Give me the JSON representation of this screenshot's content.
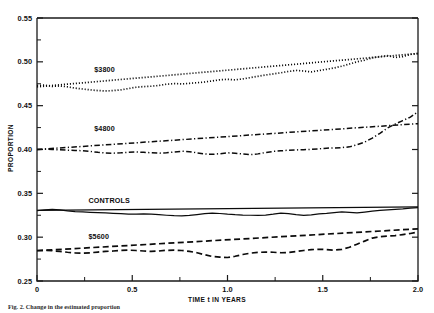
{
  "figure": {
    "caption": "Fig. 2.  Change in the estimated proportion"
  },
  "chart_data": {
    "type": "line",
    "title": "",
    "xlabel": "TIME t IN YEARS",
    "ylabel": "PROPORTION",
    "xlim": [
      0,
      2.0
    ],
    "ylim": [
      0.25,
      0.55
    ],
    "xticks": [
      0,
      0.5,
      1.0,
      1.5,
      2.0
    ],
    "xticklabels": [
      "0",
      "0.5",
      "1.0",
      "1.5",
      "2.0"
    ],
    "yticks": [
      0.25,
      0.3,
      0.35,
      0.4,
      0.45,
      0.5,
      0.55
    ],
    "yticklabels": [
      "0.25",
      "0.30",
      "0.35",
      "0.40",
      "0.45",
      "0.50",
      "0.55"
    ],
    "grid": false,
    "legend_position": "inline-labels",
    "minor_ticks": true,
    "series": [
      {
        "name": "$3800",
        "label": "$3800",
        "linestyle": "dotted",
        "label_x": 0.3,
        "label_y": 0.4885,
        "trend": {
          "linestyle": "dotted",
          "x": [
            0,
            2.0
          ],
          "values": [
            0.4715,
            0.5095
          ]
        },
        "x": [
          0.0,
          0.04,
          0.08,
          0.12,
          0.16,
          0.2,
          0.24,
          0.28,
          0.32,
          0.36,
          0.4,
          0.44,
          0.48,
          0.52,
          0.56,
          0.6,
          0.64,
          0.68,
          0.72,
          0.76,
          0.8,
          0.84,
          0.88,
          0.92,
          0.96,
          1.0,
          1.04,
          1.08,
          1.12,
          1.16,
          1.2,
          1.24,
          1.28,
          1.32,
          1.36,
          1.4,
          1.44,
          1.48,
          1.52,
          1.56,
          1.6,
          1.64,
          1.68,
          1.72,
          1.76,
          1.8,
          1.84,
          1.88,
          1.92,
          1.96,
          2.0
        ],
        "values": [
          0.473,
          0.4735,
          0.472,
          0.4725,
          0.4715,
          0.47,
          0.469,
          0.468,
          0.4672,
          0.4668,
          0.4672,
          0.468,
          0.4695,
          0.471,
          0.4718,
          0.4722,
          0.473,
          0.4745,
          0.4752,
          0.4748,
          0.4755,
          0.4762,
          0.477,
          0.4782,
          0.4795,
          0.48,
          0.4795,
          0.4805,
          0.482,
          0.4835,
          0.485,
          0.4862,
          0.4875,
          0.489,
          0.4902,
          0.4895,
          0.4885,
          0.49,
          0.4915,
          0.493,
          0.495,
          0.4975,
          0.5,
          0.502,
          0.5045,
          0.506,
          0.507,
          0.505,
          0.506,
          0.5085,
          0.5095
        ]
      },
      {
        "name": "$4800",
        "label": "$4800",
        "linestyle": "dashdot",
        "label_x": 0.3,
        "label_y": 0.4215,
        "trend": {
          "linestyle": "dashdot",
          "x": [
            0,
            2.0
          ],
          "values": [
            0.4,
            0.4295
          ]
        },
        "x": [
          0.0,
          0.04,
          0.08,
          0.12,
          0.16,
          0.2,
          0.24,
          0.28,
          0.32,
          0.36,
          0.4,
          0.44,
          0.48,
          0.52,
          0.56,
          0.6,
          0.64,
          0.68,
          0.72,
          0.76,
          0.8,
          0.84,
          0.88,
          0.92,
          0.96,
          1.0,
          1.04,
          1.08,
          1.12,
          1.16,
          1.2,
          1.24,
          1.28,
          1.32,
          1.36,
          1.4,
          1.44,
          1.48,
          1.52,
          1.56,
          1.6,
          1.64,
          1.68,
          1.72,
          1.76,
          1.8,
          1.84,
          1.88,
          1.92,
          1.96,
          2.0
        ],
        "values": [
          0.4,
          0.4005,
          0.4,
          0.3996,
          0.3992,
          0.399,
          0.3985,
          0.3978,
          0.3968,
          0.396,
          0.3958,
          0.3962,
          0.3968,
          0.3972,
          0.3968,
          0.3962,
          0.3958,
          0.3962,
          0.3972,
          0.398,
          0.3975,
          0.3962,
          0.395,
          0.3945,
          0.3952,
          0.3962,
          0.3958,
          0.3948,
          0.3942,
          0.395,
          0.3965,
          0.3978,
          0.3985,
          0.3992,
          0.3995,
          0.3998,
          0.4002,
          0.4008,
          0.4015,
          0.4018,
          0.4022,
          0.403,
          0.4055,
          0.4085,
          0.413,
          0.4185,
          0.4245,
          0.429,
          0.433,
          0.437,
          0.443
        ]
      },
      {
        "name": "CONTROLS",
        "label": "CONTROLS",
        "linestyle": "solid",
        "label_x": 0.27,
        "label_y": 0.3395,
        "trend": {
          "linestyle": "solid",
          "x": [
            0,
            2.0
          ],
          "values": [
            0.3305,
            0.3345
          ]
        },
        "x": [
          0.0,
          0.04,
          0.08,
          0.12,
          0.16,
          0.2,
          0.24,
          0.28,
          0.32,
          0.36,
          0.4,
          0.44,
          0.48,
          0.52,
          0.56,
          0.6,
          0.64,
          0.68,
          0.72,
          0.76,
          0.8,
          0.84,
          0.88,
          0.92,
          0.96,
          1.0,
          1.04,
          1.08,
          1.12,
          1.16,
          1.2,
          1.24,
          1.28,
          1.32,
          1.36,
          1.4,
          1.44,
          1.48,
          1.52,
          1.56,
          1.6,
          1.64,
          1.68,
          1.72,
          1.76,
          1.8,
          1.84,
          1.88,
          1.92,
          1.96,
          2.0
        ],
        "values": [
          0.3302,
          0.331,
          0.3316,
          0.3312,
          0.33,
          0.3292,
          0.3288,
          0.3284,
          0.328,
          0.3276,
          0.3272,
          0.3268,
          0.3264,
          0.3262,
          0.3266,
          0.3262,
          0.3256,
          0.325,
          0.3245,
          0.3242,
          0.3248,
          0.3258,
          0.3268,
          0.3275,
          0.327,
          0.3262,
          0.3256,
          0.3252,
          0.325,
          0.3248,
          0.3252,
          0.3262,
          0.3275,
          0.3268,
          0.3256,
          0.3248,
          0.3254,
          0.3266,
          0.3272,
          0.328,
          0.3288,
          0.3282,
          0.3276,
          0.3286,
          0.3298,
          0.3305,
          0.3312,
          0.3318,
          0.3322,
          0.333,
          0.3336
        ]
      },
      {
        "name": "$5600",
        "label": "$5600",
        "linestyle": "dashed",
        "label_x": 0.27,
        "label_y": 0.2975,
        "trend": {
          "linestyle": "dashed",
          "x": [
            0,
            2.0
          ],
          "values": [
            0.2845,
            0.3095
          ]
        },
        "x": [
          0.0,
          0.04,
          0.08,
          0.12,
          0.16,
          0.2,
          0.24,
          0.28,
          0.32,
          0.36,
          0.4,
          0.44,
          0.48,
          0.52,
          0.56,
          0.6,
          0.64,
          0.68,
          0.72,
          0.76,
          0.8,
          0.84,
          0.88,
          0.92,
          0.96,
          1.0,
          1.04,
          1.08,
          1.12,
          1.16,
          1.2,
          1.24,
          1.28,
          1.32,
          1.36,
          1.4,
          1.44,
          1.48,
          1.52,
          1.56,
          1.6,
          1.64,
          1.68,
          1.72,
          1.76,
          1.8,
          1.84,
          1.88,
          1.92,
          1.96,
          2.0
        ],
        "values": [
          0.2848,
          0.285,
          0.2845,
          0.2838,
          0.2828,
          0.282,
          0.2818,
          0.2822,
          0.283,
          0.2838,
          0.2842,
          0.2848,
          0.2852,
          0.2848,
          0.2842,
          0.2838,
          0.2842,
          0.285,
          0.2852,
          0.2848,
          0.2838,
          0.2822,
          0.28,
          0.278,
          0.2772,
          0.2768,
          0.2782,
          0.2802,
          0.2818,
          0.2826,
          0.283,
          0.2828,
          0.2822,
          0.2826,
          0.2836,
          0.2848,
          0.2858,
          0.2862,
          0.2858,
          0.2852,
          0.286,
          0.2885,
          0.292,
          0.2955,
          0.299,
          0.3005,
          0.3012,
          0.3018,
          0.303,
          0.3042,
          0.3058
        ]
      }
    ]
  }
}
